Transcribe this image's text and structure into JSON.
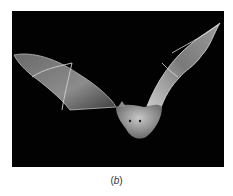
{
  "figure": {
    "background_color": "#020202",
    "caption_open": "(",
    "caption_letter": "b",
    "caption_close": ")"
  }
}
